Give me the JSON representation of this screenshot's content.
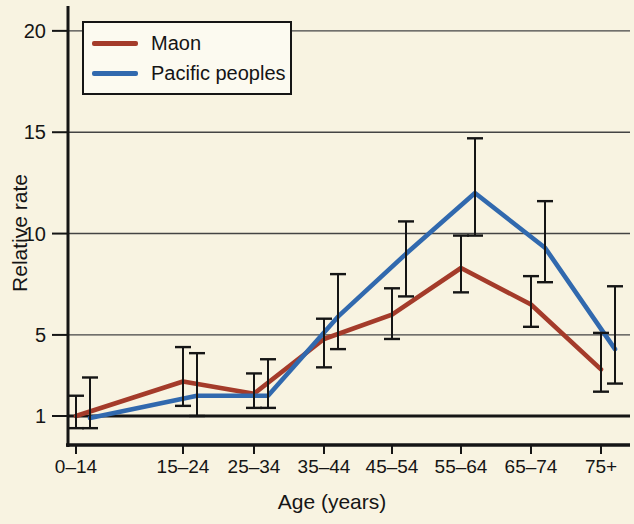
{
  "chart_data": {
    "type": "line",
    "xlabel": "Age (years)",
    "ylabel": "Relative rate",
    "categories": [
      "0–14",
      "15–24",
      "25–34",
      "35–44",
      "45–54",
      "55–64",
      "65–74",
      "75+"
    ],
    "yticks": [
      1,
      5,
      10,
      15,
      20
    ],
    "ylim": [
      0,
      21
    ],
    "baseline": 1,
    "grid": "horizontal gridlines at 5, 10, 15, 20; heavy reference line at 1",
    "legend_position": "top-left",
    "error_bars": true,
    "colors": {
      "background": "#f8f3e1",
      "axis": "#151515",
      "grid": "#444444"
    },
    "series": [
      {
        "name": "Maon",
        "color": "#a43b2a",
        "values": [
          1.0,
          2.7,
          2.1,
          4.8,
          6.0,
          8.3,
          6.5,
          3.3
        ],
        "ci_low": [
          0.4,
          1.5,
          1.4,
          3.4,
          4.8,
          7.1,
          5.4,
          2.2
        ],
        "ci_high": [
          2.0,
          4.4,
          3.1,
          5.8,
          7.3,
          9.9,
          7.9,
          5.1
        ]
      },
      {
        "name": "Pacific peoples",
        "color": "#3169ae",
        "values": [
          0.9,
          2.0,
          2.0,
          5.9,
          9.0,
          12.0,
          9.3,
          4.3
        ],
        "ci_low": [
          0.4,
          1.0,
          1.4,
          4.3,
          6.9,
          9.9,
          7.6,
          2.6
        ],
        "ci_high": [
          2.9,
          4.1,
          3.8,
          8.0,
          10.6,
          14.7,
          11.6,
          7.4
        ]
      }
    ]
  }
}
